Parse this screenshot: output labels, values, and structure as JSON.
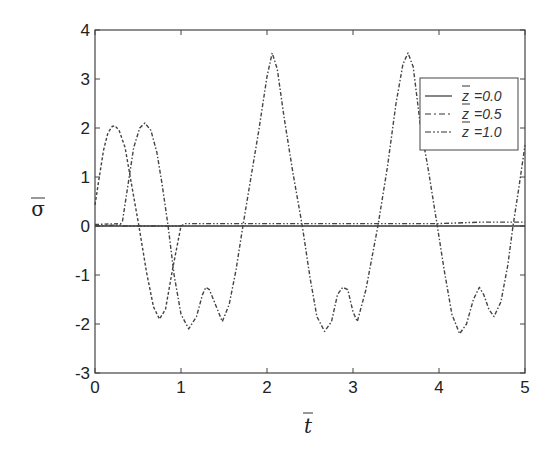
{
  "chart_data": {
    "type": "line",
    "title": "",
    "xlabel": "t̄",
    "ylabel": "σ̄",
    "xlim": [
      0,
      5
    ],
    "ylim": [
      -3,
      4
    ],
    "xticks": [
      0,
      1,
      2,
      3,
      4,
      5
    ],
    "yticks": [
      -3,
      -2,
      -1,
      0,
      1,
      2,
      3,
      4
    ],
    "grid": false,
    "legend_position": "upper right",
    "series": [
      {
        "name": "z̄ =0.0",
        "style": "dashed",
        "x": [
          0.0,
          0.05,
          0.1,
          0.15,
          0.2,
          0.23,
          0.28,
          0.35,
          0.42,
          0.51,
          0.6,
          0.68,
          0.75,
          0.82,
          0.9,
          1.0
        ],
        "y": [
          0.43,
          1.0,
          1.55,
          1.9,
          2.03,
          2.05,
          1.95,
          1.6,
          0.9,
          0.0,
          -0.95,
          -1.65,
          -1.9,
          -1.7,
          -0.9,
          0.0
        ]
      },
      {
        "name": "z̄ =0.5",
        "style": "dash-dot",
        "x": [
          0.0,
          0.3,
          0.32,
          0.38,
          0.45,
          0.52,
          0.58,
          0.65,
          0.72,
          0.78,
          0.85,
          0.92,
          1.0,
          1.09,
          1.18,
          1.25,
          1.29,
          1.33,
          1.4,
          1.48,
          1.56,
          1.64,
          1.72,
          1.8,
          1.9,
          2.0,
          2.06,
          2.12,
          2.2,
          2.3,
          2.41,
          2.5,
          2.58,
          2.67,
          2.75,
          2.82,
          2.88,
          2.94,
          3.0,
          3.05,
          3.15,
          3.29,
          3.4,
          3.5,
          3.58,
          3.64,
          3.7,
          3.78,
          3.88,
          3.98,
          4.06,
          4.15,
          4.24,
          4.32,
          4.4,
          4.47,
          4.52,
          4.58,
          4.64,
          4.72,
          4.8,
          4.86,
          4.93,
          5.0
        ],
        "y": [
          0.03,
          0.05,
          0.1,
          0.8,
          1.6,
          2.0,
          2.1,
          1.95,
          1.5,
          0.85,
          0.0,
          -1.0,
          -1.8,
          -2.1,
          -1.85,
          -1.4,
          -1.25,
          -1.3,
          -1.6,
          -1.95,
          -1.6,
          -0.9,
          0.0,
          0.85,
          1.9,
          3.05,
          3.53,
          3.2,
          2.2,
          1.1,
          0.0,
          -1.05,
          -1.85,
          -2.15,
          -1.95,
          -1.4,
          -1.25,
          -1.3,
          -1.75,
          -1.95,
          -1.3,
          0.0,
          1.2,
          2.5,
          3.3,
          3.53,
          3.25,
          2.1,
          1.1,
          0.0,
          -0.9,
          -1.8,
          -2.2,
          -2.0,
          -1.5,
          -1.25,
          -1.4,
          -1.7,
          -1.85,
          -1.55,
          -0.8,
          0.0,
          0.8,
          1.65
        ]
      },
      {
        "name": "z̄ =1.0",
        "style": "dash-dot-dot",
        "x": [
          0.0,
          0.3,
          0.32,
          1.0,
          1.05,
          4.0,
          4.5,
          5.0
        ],
        "y": [
          0.0,
          0.02,
          0.0,
          0.0,
          0.05,
          0.05,
          0.08,
          0.08
        ]
      }
    ]
  },
  "axes": {
    "xlabel_base": "t",
    "ylabel_base": "σ"
  },
  "legend": {
    "items": [
      {
        "label": "=0.0",
        "var": "z"
      },
      {
        "label": "=0.5",
        "var": "z"
      },
      {
        "label": "=1.0",
        "var": "z"
      }
    ]
  }
}
